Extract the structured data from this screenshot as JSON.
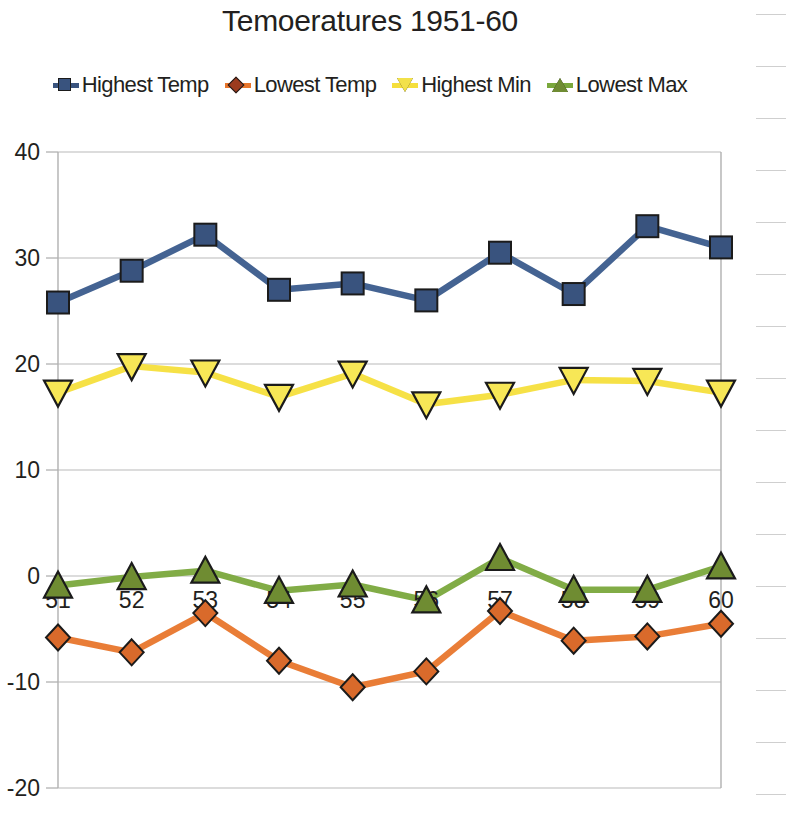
{
  "chart_data": {
    "type": "line",
    "title": "Temoeratures 1951-60",
    "xlabel": "",
    "ylabel": "",
    "categories": [
      "51",
      "52",
      "53",
      "54",
      "55",
      "56",
      "57",
      "58",
      "59",
      "60"
    ],
    "ylim": [
      -20,
      40
    ],
    "yticks": [
      40,
      30,
      20,
      10,
      0,
      -10,
      -20
    ],
    "grid": true,
    "legend_position": "top",
    "series": [
      {
        "name": "Highest Temp",
        "color": "#3a5b8c",
        "marker": "square",
        "values": [
          25.8,
          28.8,
          32.2,
          27.0,
          27.6,
          26.0,
          30.5,
          26.6,
          33.0,
          31.0
        ]
      },
      {
        "name": "Lowest Temp",
        "color": "#e8762c",
        "marker": "diamond",
        "values": [
          -5.8,
          -7.2,
          -3.5,
          -8.0,
          -10.5,
          -9.0,
          -3.3,
          -6.1,
          -5.7,
          -4.5
        ]
      },
      {
        "name": "Highest Min",
        "color": "#f5df3c",
        "marker": "triangle-down",
        "values": [
          17.3,
          19.8,
          19.2,
          16.9,
          19.1,
          16.2,
          17.1,
          18.5,
          18.4,
          17.3
        ]
      },
      {
        "name": "Lowest Max",
        "color": "#7aa83c",
        "marker": "triangle-up",
        "values": [
          -0.9,
          -0.1,
          0.5,
          -1.4,
          -0.8,
          -2.3,
          1.7,
          -1.3,
          -1.3,
          0.9
        ]
      }
    ]
  },
  "legend": {
    "items": [
      {
        "label": "Highest Temp",
        "marker_fill": "#39537e",
        "line_color": "#39537e",
        "shape": "square"
      },
      {
        "label": "Lowest Temp",
        "marker_fill": "#9c3b1e",
        "line_color": "#e8762c",
        "shape": "diamond"
      },
      {
        "label": "Highest Min",
        "marker_fill": "#f2e14a",
        "line_color": "#f5df3c",
        "shape": "triangle-down"
      },
      {
        "label": "Lowest Max",
        "marker_fill": "#6f8c32",
        "line_color": "#7aa83c",
        "shape": "triangle-up"
      }
    ]
  },
  "page": {
    "rule_lines": [
      14,
      66,
      118,
      170,
      222,
      274,
      326,
      378,
      430,
      482,
      534,
      586,
      638,
      690,
      742,
      794
    ]
  }
}
